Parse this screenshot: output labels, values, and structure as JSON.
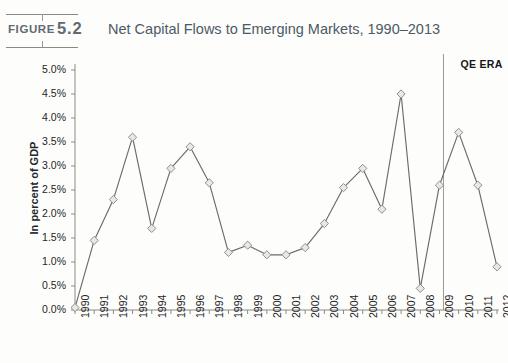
{
  "figure": {
    "label": "FIGURE",
    "number": "5.2",
    "title": "Net Capital Flows to Emerging Markets, 1990–2013"
  },
  "annotations": {
    "qe_era": "QE ERA"
  },
  "source_note": "",
  "colors": {
    "line": "#6b6b6b",
    "marker_fill": "#e8e8e4",
    "marker_stroke": "#8f8f8f",
    "axis": "#8a8a84",
    "title_text": "#4c5a66",
    "divider": "#9a9a94"
  },
  "chart_data": {
    "type": "line",
    "title": "Net Capital Flows to Emerging Markets, 1990–2013",
    "xlabel": "",
    "ylabel": "In percent of GDP",
    "ylim": [
      0.0,
      5.0
    ],
    "ytick_labels": [
      "0.0%",
      "0.5%",
      "1.0%",
      "1.5%",
      "2.0%",
      "2.5%",
      "3.0%",
      "3.5%",
      "4.0%",
      "4.5%",
      "5.0%"
    ],
    "ytick_values": [
      0.0,
      0.5,
      1.0,
      1.5,
      2.0,
      2.5,
      3.0,
      3.5,
      4.0,
      4.5,
      5.0
    ],
    "grid": false,
    "legend": "none",
    "categories": [
      "1990",
      "1991",
      "1992",
      "1993",
      "1994",
      "1995",
      "1996",
      "1997",
      "1998",
      "1999",
      "2000",
      "2001",
      "2002",
      "2003",
      "2004",
      "2005",
      "2006",
      "2007",
      "2008",
      "2009",
      "2010",
      "2011",
      "2012"
    ],
    "values": [
      0.05,
      1.45,
      2.3,
      3.6,
      1.7,
      2.95,
      3.4,
      2.65,
      1.2,
      1.35,
      1.15,
      1.15,
      1.3,
      1.8,
      2.55,
      2.95,
      2.1,
      4.5,
      0.45,
      2.6,
      3.7,
      2.6,
      0.9
    ],
    "annotations": [
      {
        "text": "QE ERA",
        "type": "vertical-divider-label",
        "x_at": "2009"
      }
    ]
  }
}
